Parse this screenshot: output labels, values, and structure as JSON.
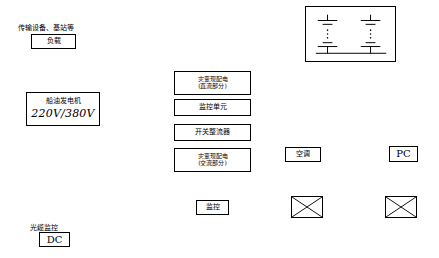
{
  "diagram": {
    "title_text": "传输设备、基站等",
    "nodes": [
      {
        "id": "load",
        "label": "负载"
      },
      {
        "id": "gen",
        "label_line1": "船油发电机",
        "voltage": "220V/380V"
      },
      {
        "id": "dc_label",
        "label": "光缆监控"
      },
      {
        "id": "dc_box",
        "label": "DC"
      },
      {
        "id": "fire_power",
        "line1": "灾变现配电",
        "line2": "(直流部分)"
      },
      {
        "id": "monitor_unit",
        "label": "监控单元"
      },
      {
        "id": "switch_power",
        "label": "开关整流器"
      },
      {
        "id": "fire_field",
        "line1": "灾变现配电",
        "line2": "(交流部分)"
      },
      {
        "id": "monitor",
        "label": "监控"
      },
      {
        "id": "air_cond",
        "label": "空调"
      },
      {
        "id": "pc",
        "label": "PC"
      }
    ],
    "icons": [
      {
        "id": "battery-bank",
        "name": "battery-bank-icon"
      },
      {
        "id": "x-box-1",
        "name": "crossed-box-icon"
      },
      {
        "id": "x-box-2",
        "name": "crossed-box-icon"
      }
    ]
  }
}
